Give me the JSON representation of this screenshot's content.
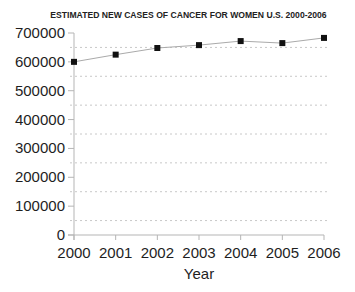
{
  "chart_data": {
    "type": "line",
    "title": "ESTIMATED NEW CASES OF CANCER FOR WOMEN U.S. 2000-2006",
    "xlabel": "Year",
    "ylabel": "",
    "categories": [
      "2000",
      "2001",
      "2002",
      "2003",
      "2004",
      "2005",
      "2006"
    ],
    "series": [
      {
        "name": "Estimated new cases (women)",
        "values": [
          600000,
          625000,
          648000,
          658000,
          672000,
          665000,
          683000
        ],
        "marker": "square",
        "line_color": "#aaaaaa",
        "marker_color": "#111111"
      }
    ],
    "ylim": [
      0,
      700000
    ],
    "yticks": [
      "0",
      "100000",
      "200000",
      "300000",
      "400000",
      "500000",
      "600000",
      "700000"
    ],
    "grid": {
      "horizontal": "dashed minor (midpoints)",
      "vertical": false
    },
    "legend": "none"
  }
}
